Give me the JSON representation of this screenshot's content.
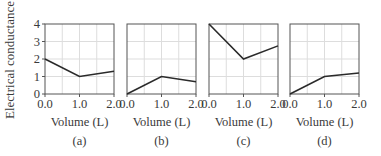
{
  "chart_data": [
    {
      "type": "line",
      "panel_label": "(a)",
      "xlabel": "Volume (L)",
      "ylabel": "Electrical conductance",
      "x": [
        0.0,
        1.0,
        2.0
      ],
      "values": [
        2.0,
        1.0,
        1.3
      ],
      "xticks": [
        "0.0",
        "1.0",
        "2.0"
      ],
      "yticks": [
        "0",
        "1",
        "2",
        "3",
        "4"
      ],
      "xlim": [
        0,
        2
      ],
      "ylim": [
        0,
        4
      ],
      "grid": true
    },
    {
      "type": "line",
      "panel_label": "(b)",
      "xlabel": "Volume (L)",
      "x": [
        0.0,
        1.0,
        2.0
      ],
      "values": [
        0.0,
        1.0,
        0.7
      ],
      "xticks": [
        "0.0",
        "1.0",
        "2.0"
      ],
      "xlim": [
        0,
        2
      ],
      "ylim": [
        0,
        4
      ],
      "grid": true
    },
    {
      "type": "line",
      "panel_label": "(c)",
      "xlabel": "Volume (L)",
      "x": [
        0.0,
        1.0,
        2.0
      ],
      "values": [
        4.0,
        2.0,
        2.75
      ],
      "xticks": [
        "0.0",
        "1.0",
        "2.0"
      ],
      "xlim": [
        0,
        2
      ],
      "ylim": [
        0,
        4
      ],
      "grid": true
    },
    {
      "type": "line",
      "panel_label": "(d)",
      "xlabel": "Volume (L)",
      "x": [
        0.0,
        1.0,
        2.0
      ],
      "values": [
        0.0,
        1.0,
        1.2
      ],
      "xticks": [
        "0.0",
        "1.0",
        "2.0"
      ],
      "xlim": [
        0,
        2
      ],
      "ylim": [
        0,
        4
      ],
      "grid": true
    }
  ],
  "labels": {
    "ylabel": "Electrical conductance",
    "xlabel": "Volume (L)"
  },
  "colors": {
    "line": "#2a2a2a",
    "axis": "#555555",
    "grid": "#dddddd"
  }
}
